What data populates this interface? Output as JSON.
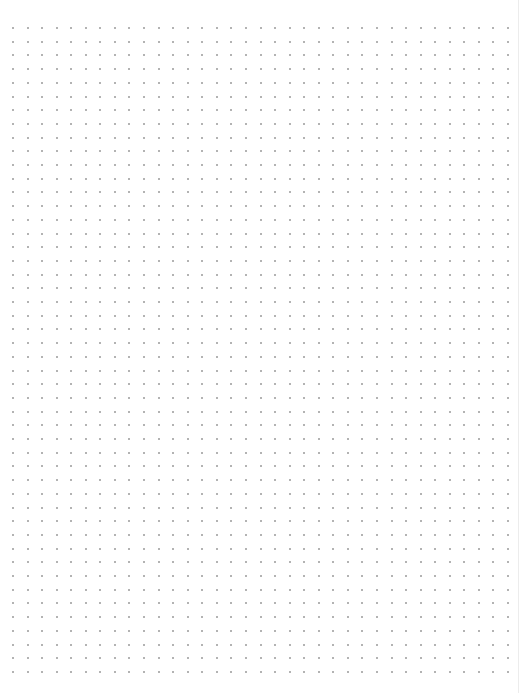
{
  "page": {
    "type": "dot-grid-paper",
    "width": 522,
    "height": 693,
    "background_color": "#ffffff",
    "edge_line_color": "#ececec"
  },
  "grid": {
    "columns": 35,
    "rows": 48,
    "origin_x": 13,
    "origin_y": 28,
    "spacing_x": 14.56,
    "spacing_y": 13.7,
    "dot_size": 2,
    "dot_color": "#9a9a9a"
  }
}
